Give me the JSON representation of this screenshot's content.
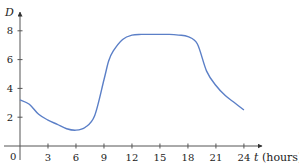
{
  "chart_data": {
    "type": "line",
    "title": "",
    "xlabel": "t (hours)",
    "xlabel_var": "t",
    "xlabel_unit": "(hours)",
    "ylabel": "D",
    "xlim": [
      0,
      25
    ],
    "ylim": [
      0,
      9
    ],
    "x_ticks": [
      3,
      6,
      9,
      12,
      15,
      18,
      21,
      24
    ],
    "y_ticks": [
      2,
      4,
      6,
      8
    ],
    "origin_label": "0",
    "grid": false,
    "legend": null,
    "series": [
      {
        "name": "D(t)",
        "color": "#5b7fc7",
        "x": [
          0,
          1,
          2,
          3,
          4,
          5,
          6,
          7,
          8,
          9,
          9.5,
          10,
          11,
          12,
          13,
          14,
          15,
          16,
          17,
          18,
          19,
          20,
          21,
          22,
          23,
          24
        ],
        "y": [
          3.2,
          2.9,
          2.2,
          1.8,
          1.5,
          1.2,
          1.1,
          1.3,
          2.1,
          4.6,
          5.9,
          6.6,
          7.4,
          7.7,
          7.75,
          7.75,
          7.75,
          7.75,
          7.7,
          7.6,
          7.1,
          5.2,
          4.2,
          3.5,
          3.0,
          2.5
        ]
      }
    ]
  }
}
